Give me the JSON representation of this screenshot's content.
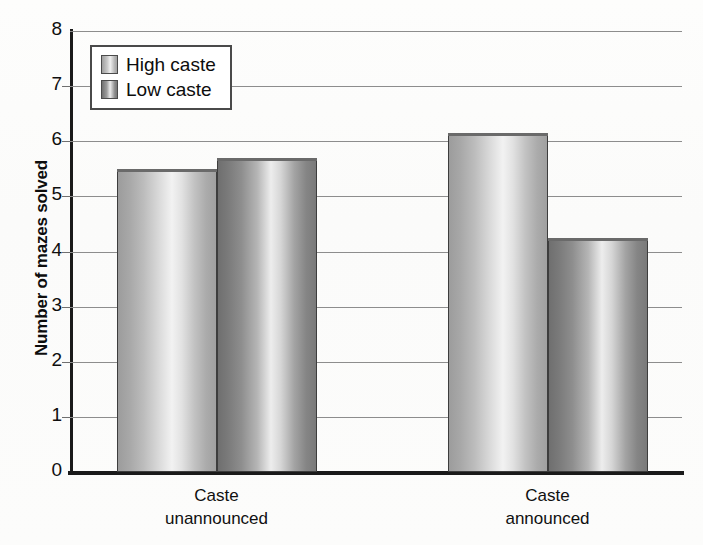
{
  "chart_data": {
    "type": "bar",
    "title": "",
    "xlabel": "",
    "ylabel": "Number of mazes solved",
    "ylim": [
      0,
      8
    ],
    "ytick_labels": [
      "0",
      "1",
      "2",
      "3",
      "4",
      "5",
      "6",
      "7",
      "8"
    ],
    "yticks": [
      0,
      1,
      2,
      3,
      4,
      5,
      6,
      7,
      8
    ],
    "grid": true,
    "grid_axis": "y",
    "legend_position": "upper-left",
    "categories": [
      "Caste unannounced",
      "Caste announced"
    ],
    "category_lines": [
      [
        "Caste",
        "unannounced"
      ],
      [
        "Caste",
        "announced"
      ]
    ],
    "series": [
      {
        "name": "High caste",
        "values": [
          5.5,
          6.15
        ],
        "fill": "light-gray-cylinder",
        "color": "#c9c9c9"
      },
      {
        "name": "Low caste",
        "values": [
          5.7,
          4.25
        ],
        "fill": "dark-gray-cylinder",
        "color": "#8d8d8d"
      }
    ]
  },
  "legend": {
    "entries": [
      {
        "label": "High caste",
        "swatch": "high"
      },
      {
        "label": "Low caste",
        "swatch": "low"
      }
    ]
  },
  "colors": {
    "axis": "#1a1a1a",
    "gridline": "#8d8d8d",
    "background": "#ffffff",
    "text": "#0d0d0d"
  }
}
